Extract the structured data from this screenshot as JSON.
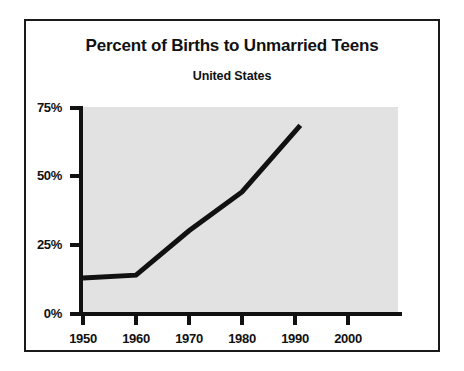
{
  "chart_data": {
    "type": "line",
    "title": "Percent of Births to Unmarried Teens",
    "subtitle": "United States",
    "xlabel": "",
    "ylabel": "",
    "xlim": [
      1950,
      2000
    ],
    "ylim": [
      0,
      75
    ],
    "grid": false,
    "legend": null,
    "x_ticks": [
      "1950",
      "1960",
      "1970",
      "1980",
      "1990",
      "2000"
    ],
    "x_tick_values": [
      1950,
      1960,
      1970,
      1980,
      1990,
      2000
    ],
    "y_ticks": [
      "0%",
      "25%",
      "50%",
      "75%"
    ],
    "y_tick_values": [
      0,
      25,
      50,
      75
    ],
    "series": [
      {
        "name": "Percent of births to unmarried teens",
        "x": [
          1950,
          1960,
          1970,
          1980,
          1991
        ],
        "values": [
          13,
          14,
          30,
          44,
          68
        ],
        "color": "#111111"
      }
    ],
    "plot_background": "#e2e2e2",
    "frame_color": "#1a1a1a"
  }
}
